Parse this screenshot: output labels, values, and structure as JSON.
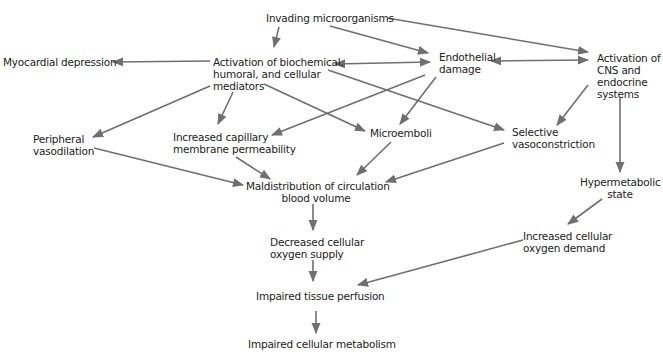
{
  "diagram": {
    "colors": {
      "arrow": "#6f6f6f",
      "text": "#222222",
      "background": "#ffffff"
    },
    "nodes": {
      "invading": {
        "lines": [
          "Invading microorganisms"
        ]
      },
      "mediators": {
        "lines": [
          "Activation of biochemical,",
          "humoral, and cellular",
          "mediators"
        ]
      },
      "myocardial": {
        "lines": [
          "Myocardial depression"
        ]
      },
      "endothelial": {
        "lines": [
          "Endothelial",
          "damage"
        ]
      },
      "cns": {
        "lines": [
          "Activation of",
          "CNS and",
          "endocrine",
          "systems"
        ]
      },
      "peripheral": {
        "lines": [
          "Peripheral",
          "vasodilation"
        ]
      },
      "capillary": {
        "lines": [
          "Increased capillary",
          "membrane permeability"
        ]
      },
      "microemboli": {
        "lines": [
          "Microemboli"
        ]
      },
      "selective": {
        "lines": [
          "Selective",
          "vasoconstriction"
        ]
      },
      "maldistribution": {
        "lines": [
          "Maldistribution of circulation",
          "blood volume"
        ]
      },
      "hypermetabolic": {
        "lines": [
          "Hypermetabolic",
          "state"
        ]
      },
      "decreased_supply": {
        "lines": [
          "Decreased cellular",
          "oxygen supply"
        ]
      },
      "increased_demand": {
        "lines": [
          "Increased cellular",
          "oxygen demand"
        ]
      },
      "impaired_perfusion": {
        "lines": [
          "Impaired tissue perfusion"
        ]
      },
      "impaired_metabolism": {
        "lines": [
          "Impaired cellular metabolism"
        ]
      }
    },
    "edges": [
      {
        "from": "invading",
        "to": "mediators"
      },
      {
        "from": "invading",
        "to": "endothelial"
      },
      {
        "from": "invading",
        "to": "cns"
      },
      {
        "from": "mediators",
        "to": "myocardial"
      },
      {
        "from": "mediators",
        "to": "endothelial",
        "bidirectional": true
      },
      {
        "from": "endothelial",
        "to": "cns",
        "bidirectional": true
      },
      {
        "from": "mediators",
        "to": "peripheral"
      },
      {
        "from": "mediators",
        "to": "capillary"
      },
      {
        "from": "mediators",
        "to": "microemboli"
      },
      {
        "from": "mediators",
        "to": "selective"
      },
      {
        "from": "endothelial",
        "to": "capillary"
      },
      {
        "from": "endothelial",
        "to": "microemboli"
      },
      {
        "from": "cns",
        "to": "selective"
      },
      {
        "from": "cns",
        "to": "hypermetabolic"
      },
      {
        "from": "peripheral",
        "to": "maldistribution"
      },
      {
        "from": "capillary",
        "to": "maldistribution"
      },
      {
        "from": "microemboli",
        "to": "maldistribution"
      },
      {
        "from": "selective",
        "to": "maldistribution"
      },
      {
        "from": "maldistribution",
        "to": "decreased_supply"
      },
      {
        "from": "hypermetabolic",
        "to": "increased_demand"
      },
      {
        "from": "decreased_supply",
        "to": "impaired_perfusion"
      },
      {
        "from": "increased_demand",
        "to": "impaired_perfusion"
      },
      {
        "from": "impaired_perfusion",
        "to": "impaired_metabolism"
      }
    ]
  }
}
